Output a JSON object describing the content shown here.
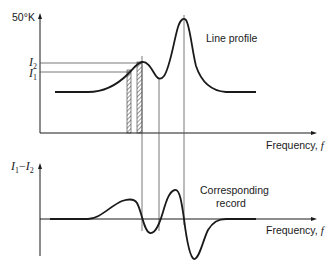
{
  "top_plot": {
    "y_axis_label": "50°K",
    "level_labels": [
      {
        "base": "I",
        "sub": "2"
      },
      {
        "base": "I",
        "sub": "1"
      }
    ],
    "curve_label": "Line profile",
    "x_axis_label": "Frequency, ",
    "x_axis_symbol": "f"
  },
  "bottom_plot": {
    "y_axis_label": {
      "a": "I",
      "a_sub": "1",
      "op": "−",
      "b": "I",
      "b_sub": "2"
    },
    "curve_label_line1": "Corresponding",
    "curve_label_line2": "record",
    "x_axis_label": "Frequency, ",
    "x_axis_symbol": "f"
  },
  "colors": {
    "ink": "#1a1a1a",
    "thin_line": "#555555",
    "background": "#ffffff"
  }
}
